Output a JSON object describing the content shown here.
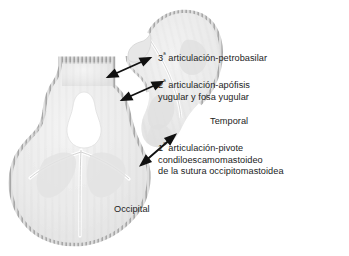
{
  "figure": {
    "background_color": "#ffffff",
    "bone_fill_color": "#ececec",
    "bone_shade_color": "#dcdcdc",
    "suture_color": "#9a9a9a",
    "arrow_color": "#111111",
    "text_color": "#1c1c1c"
  },
  "labels": {
    "articulation_3": {
      "ordinal": "3",
      "ordinal_suffix": "ª",
      "text": " articulación-petrobasilar"
    },
    "articulation_2": {
      "ordinal": "2",
      "ordinal_suffix": "ª",
      "line1": " articulación-apófisis",
      "line2": "yugular y fosa yugular"
    },
    "articulation_1": {
      "ordinal": "1",
      "ordinal_suffix": "ª",
      "line1": " articulación-pivote",
      "line2": "condiloescamomastoideo",
      "line3": "de la sutura occipitomastoidea"
    },
    "bone_temporal": "Temporal",
    "bone_occipital": "Occipital"
  },
  "arrows": [
    {
      "name": "arrow-articulation-3",
      "direction": "double-headed",
      "orientation": "up-right"
    },
    {
      "name": "arrow-articulation-2",
      "direction": "double-headed",
      "orientation": "up-right"
    },
    {
      "name": "arrow-articulation-1",
      "direction": "double-headed",
      "orientation": "up-right-steep"
    }
  ],
  "structures": [
    {
      "name": "occipital-bone",
      "description": "Hueso occipital visto por su cara endocraneal"
    },
    {
      "name": "foramen-magnum",
      "description": "Agujero occipital"
    },
    {
      "name": "temporal-bone",
      "description": "Hueso temporal"
    }
  ]
}
